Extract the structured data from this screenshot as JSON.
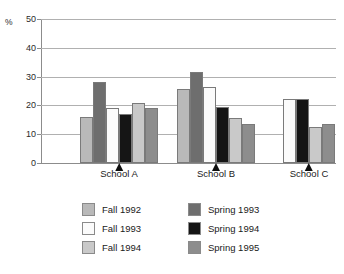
{
  "title_remnant": "",
  "chart_data": {
    "type": "bar",
    "title": "",
    "subtitle": "",
    "xlabel": "",
    "ylabel": "%",
    "ylim": [
      0,
      50
    ],
    "yticks": [
      0,
      10,
      20,
      30,
      40,
      50
    ],
    "ytick_labels": [
      "0",
      "10",
      "20",
      "30",
      "40",
      "50"
    ],
    "grid": true,
    "legend_position": "bottom",
    "categories": [
      "School A",
      "School B",
      "School C"
    ],
    "series": [
      {
        "name": "Fall 1992",
        "color": "#b9b9b9",
        "values": [
          16.0,
          25.7,
          null
        ]
      },
      {
        "name": "Spring 1993",
        "color": "#6e6e6e",
        "values": [
          28.0,
          31.7,
          null
        ]
      },
      {
        "name": "Fall 1993",
        "color": "#fbfbfb",
        "values": [
          19.0,
          26.4,
          22.3
        ]
      },
      {
        "name": "Spring 1994",
        "color": "#151515",
        "values": [
          17.0,
          19.6,
          22.3
        ]
      },
      {
        "name": "Fall 1994",
        "color": "#c9c9c9",
        "values": [
          20.7,
          15.7,
          12.4
        ]
      },
      {
        "name": "Spring 1995",
        "color": "#8d8d8d",
        "values": [
          19.0,
          13.5,
          13.4
        ]
      }
    ]
  },
  "legend": {
    "entries": [
      {
        "label": "Fall 1992",
        "color": "#b9b9b9"
      },
      {
        "label": "Spring 1993",
        "color": "#6e6e6e"
      },
      {
        "label": "Fall 1993",
        "color": "#fbfbfb"
      },
      {
        "label": "Spring 1994",
        "color": "#151515"
      },
      {
        "label": "Fall 1994",
        "color": "#c9c9c9"
      },
      {
        "label": "Spring 1995",
        "color": "#8d8d8d"
      }
    ]
  }
}
